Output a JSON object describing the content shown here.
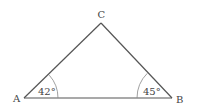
{
  "diagram": {
    "type": "triangle",
    "vertices": {
      "A": {
        "label": "A",
        "x": 24,
        "y": 98
      },
      "B": {
        "label": "B",
        "x": 172,
        "y": 98
      },
      "C": {
        "label": "C",
        "x": 101,
        "y": 23
      }
    },
    "angles": {
      "A": {
        "label": "42°",
        "value": 42
      },
      "B": {
        "label": "45°",
        "value": 45
      }
    },
    "colors": {
      "line": "#555555",
      "text": "#444444",
      "arc": "#888888"
    }
  }
}
